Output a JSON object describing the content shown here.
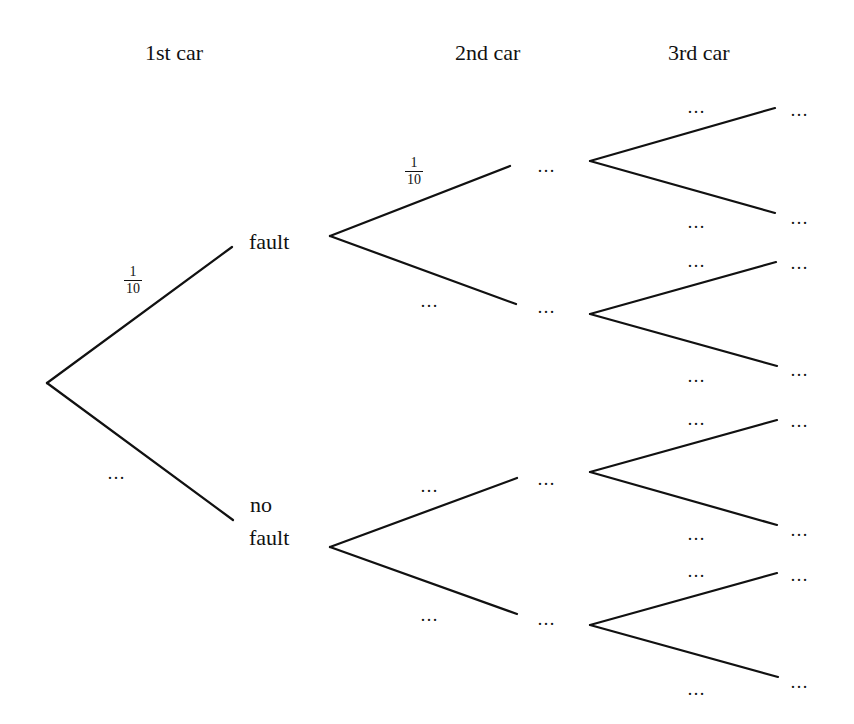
{
  "headers": {
    "first": "1st car",
    "second": "2nd car",
    "third": "3rd car"
  },
  "level1": {
    "fault_label": "fault",
    "no_fault_label_line1": "no",
    "no_fault_label_line2": "fault",
    "fault_prob": {
      "num": "1",
      "den": "10"
    },
    "no_fault_prob": "…"
  },
  "level2": {
    "fault_fault_prob": {
      "num": "1",
      "den": "10"
    },
    "fault_nofault_prob": "…",
    "nofault_fault_prob": "…",
    "nofault_nofault_prob": "…",
    "outcomes": [
      "…",
      "…",
      "…",
      "…"
    ]
  },
  "level3": {
    "branch_probs": [
      "…",
      "…",
      "…",
      "…",
      "…",
      "…",
      "…",
      "…"
    ],
    "outcomes": [
      "…",
      "…",
      "…",
      "…",
      "…",
      "…",
      "…",
      "…"
    ]
  },
  "colors": {
    "line": "#111111",
    "background": "#ffffff"
  }
}
